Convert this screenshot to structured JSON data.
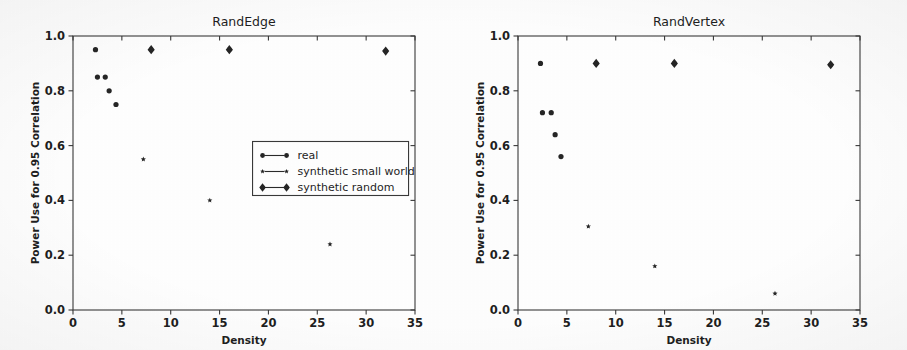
{
  "figure": {
    "background_color": "#fefefe",
    "marker_color": "#262626",
    "axis_color": "#3a3a3a",
    "panel_count": 2
  },
  "axis": {
    "xlabel": "Density",
    "ylabel": "Power Use for 0.95 Correlation",
    "xticks": [
      "0",
      "5",
      "10",
      "15",
      "20",
      "25",
      "30",
      "35"
    ],
    "yticks": [
      "0.0",
      "0.2",
      "0.4",
      "0.6",
      "0.8",
      "1.0"
    ]
  },
  "legend": {
    "position": "center-right of left panel",
    "entries": [
      {
        "label": "real",
        "marker": "circle-dot"
      },
      {
        "label": "synthetic small world",
        "marker": "small-star"
      },
      {
        "label": "synthetic random",
        "marker": "large-diamond"
      }
    ]
  },
  "chart_data": [
    {
      "type": "scatter",
      "title": "RandEdge",
      "xlabel": "Density",
      "ylabel": "Power Use for 0.95 Correlation",
      "xlim": [
        0,
        35
      ],
      "ylim": [
        0.0,
        1.0
      ],
      "xticks": [
        0,
        5,
        10,
        15,
        20,
        25,
        30,
        35
      ],
      "yticks": [
        0.0,
        0.2,
        0.4,
        0.6,
        0.8,
        1.0
      ],
      "grid": false,
      "legend_position": "center right",
      "series": [
        {
          "name": "real",
          "marker": "circle-dot",
          "marker_size": 5,
          "points": [
            [
              2.3,
              0.95
            ],
            [
              2.5,
              0.85
            ],
            [
              3.3,
              0.85
            ],
            [
              3.7,
              0.8
            ],
            [
              4.4,
              0.75
            ]
          ]
        },
        {
          "name": "synthetic small world",
          "marker": "small-star",
          "marker_size": 3,
          "points": [
            [
              7.2,
              0.55
            ],
            [
              14.0,
              0.4
            ],
            [
              26.3,
              0.24
            ]
          ]
        },
        {
          "name": "synthetic random",
          "marker": "large-diamond",
          "marker_size": 9,
          "points": [
            [
              8.0,
              0.95
            ],
            [
              16.0,
              0.95
            ],
            [
              32.0,
              0.945
            ]
          ]
        }
      ]
    },
    {
      "type": "scatter",
      "title": "RandVertex",
      "xlabel": "Density",
      "ylabel": "Power Use for 0.95 Correlation",
      "xlim": [
        0,
        35
      ],
      "ylim": [
        0.0,
        1.0
      ],
      "xticks": [
        0,
        5,
        10,
        15,
        20,
        25,
        30,
        35
      ],
      "yticks": [
        0.0,
        0.2,
        0.4,
        0.6,
        0.8,
        1.0
      ],
      "grid": false,
      "legend_position": "none",
      "series": [
        {
          "name": "real",
          "marker": "circle-dot",
          "marker_size": 5,
          "points": [
            [
              2.3,
              0.9
            ],
            [
              2.5,
              0.72
            ],
            [
              3.4,
              0.72
            ],
            [
              3.8,
              0.64
            ],
            [
              4.4,
              0.56
            ]
          ]
        },
        {
          "name": "synthetic small world",
          "marker": "small-star",
          "marker_size": 3,
          "points": [
            [
              7.2,
              0.305
            ],
            [
              14.0,
              0.16
            ],
            [
              26.3,
              0.06
            ]
          ]
        },
        {
          "name": "synthetic random",
          "marker": "large-diamond",
          "marker_size": 9,
          "points": [
            [
              8.0,
              0.9
            ],
            [
              16.0,
              0.9
            ],
            [
              32.0,
              0.895
            ]
          ]
        }
      ]
    }
  ]
}
